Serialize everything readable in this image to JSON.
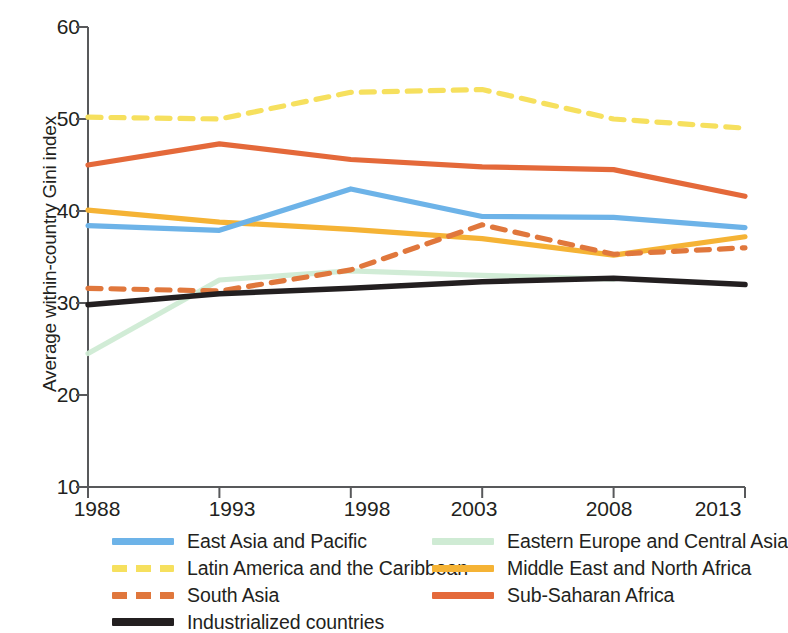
{
  "chart_data": {
    "type": "line",
    "title": "",
    "xlabel": "",
    "ylabel": "Average within-country Gini index",
    "categories": [
      "1988",
      "1993",
      "1998",
      "2003",
      "2008",
      "2013"
    ],
    "x": [
      1988,
      1993,
      1998,
      2003,
      2008,
      2013
    ],
    "xlim": [
      1988,
      2013
    ],
    "ylim": [
      10,
      60
    ],
    "yticks": [
      10,
      20,
      30,
      40,
      50,
      60
    ],
    "xticks": [
      1988,
      1993,
      1998,
      2003,
      2008,
      2013
    ],
    "grid": false,
    "legend_position": "bottom",
    "series": [
      {
        "name": "East Asia and Pacific",
        "color": "#6DB3E8",
        "style": "solid",
        "values": [
          38.4,
          37.9,
          42.4,
          39.4,
          39.3,
          38.2
        ]
      },
      {
        "name": "Latin America and the Caribbean",
        "color": "#F6E05E",
        "style": "dashed",
        "values": [
          50.2,
          50.0,
          52.9,
          53.2,
          50.0,
          49.0
        ]
      },
      {
        "name": "South Asia",
        "color": "#E0773C",
        "style": "dashed",
        "values": [
          31.6,
          31.3,
          33.6,
          38.5,
          35.3,
          36.0
        ]
      },
      {
        "name": "Industrialized countries",
        "color": "#231f20",
        "style": "solid",
        "values": [
          29.8,
          31.0,
          31.6,
          32.3,
          32.7,
          32.0
        ]
      },
      {
        "name": "Eastern Europe and Central Asia",
        "color": "#CFEBD4",
        "style": "solid",
        "values": [
          24.5,
          32.5,
          33.5,
          33.0,
          32.6,
          null
        ]
      },
      {
        "name": "Middle East and North Africa",
        "color": "#F5B335",
        "style": "solid",
        "values": [
          40.1,
          38.8,
          38.0,
          37.0,
          35.2,
          37.2
        ]
      },
      {
        "name": "Sub-Saharan Africa",
        "color": "#E4693A",
        "style": "solid",
        "values": [
          45.0,
          47.3,
          45.6,
          44.8,
          44.5,
          41.6
        ]
      }
    ]
  },
  "axis": {
    "y_label": "Average within-country Gini index",
    "y_tick_labels": [
      "60",
      "50",
      "40",
      "30",
      "20",
      "10"
    ],
    "x_tick_labels": [
      "1988",
      "1993",
      "1998",
      "2003",
      "2008",
      "2013"
    ]
  },
  "legend": {
    "left_column": [
      {
        "label": "East Asia and Pacific",
        "color": "#6DB3E8",
        "style": "solid"
      },
      {
        "label": "Latin America and the Caribbean",
        "color": "#F6E05E",
        "style": "dashed"
      },
      {
        "label": "South Asia",
        "color": "#E0773C",
        "style": "dashed"
      },
      {
        "label": "Industrialized countries",
        "color": "#231f20",
        "style": "solid"
      }
    ],
    "right_column": [
      {
        "label": "Eastern Europe and Central Asia",
        "color": "#CFEBD4",
        "style": "solid"
      },
      {
        "label": "Middle East and North Africa",
        "color": "#F5B335",
        "style": "solid"
      },
      {
        "label": "Sub-Saharan Africa",
        "color": "#E4693A",
        "style": "solid"
      }
    ]
  }
}
